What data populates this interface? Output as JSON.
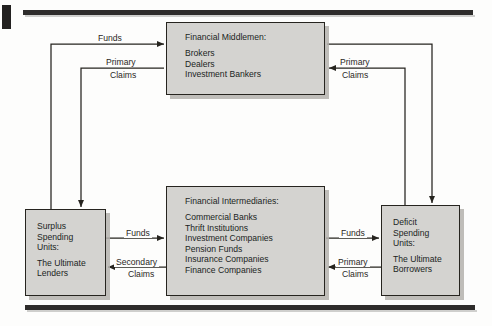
{
  "figure": {
    "type": "flow-diagram"
  },
  "nodes": {
    "middlemen": {
      "title": "Financial Middlemen:",
      "items": [
        "Brokers",
        "Dealers",
        "Investment Bankers"
      ]
    },
    "intermediaries": {
      "title": "Financial Intermediaries:",
      "items": [
        "Commercial Banks",
        "Thrift Institutions",
        "Investment Companies",
        "Pension Funds",
        "Insurance Companies",
        "Finance Companies"
      ]
    },
    "surplus": {
      "title_lines": [
        "Surplus",
        "Spending",
        "Units:"
      ],
      "sub_lines": [
        "The Ultimate",
        "Lenders"
      ]
    },
    "deficit": {
      "title_lines": [
        "Deficit",
        "Spending",
        "Units:"
      ],
      "sub_lines": [
        "The Ultimate",
        "Borrowers"
      ]
    }
  },
  "edges": {
    "top_left_funds": "Funds",
    "top_left_primary": "Primary",
    "top_left_claims": "Claims",
    "top_right_primary": "Primary",
    "top_right_claims": "Claims",
    "mid_left_funds": "Funds",
    "mid_left_secondary": "Secondary",
    "mid_left_claims": "Claims",
    "mid_right_funds": "Funds",
    "mid_right_primary": "Primary",
    "mid_right_claims": "Claims"
  },
  "colors": {
    "box_fill": "#d4d3d0",
    "box_border": "#26241f",
    "line": "#26241f",
    "rule": "#2e2c2b",
    "page": "#fdfdfc"
  }
}
